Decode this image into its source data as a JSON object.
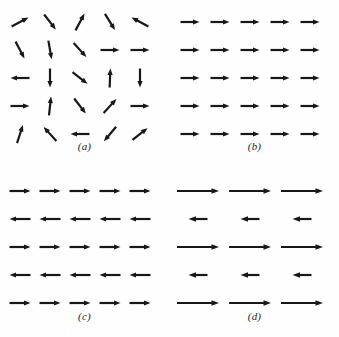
{
  "figure": {
    "background_color": "#fefefe",
    "arrow_color": "#18181a",
    "panel_grid": "2x2",
    "panels": [
      {
        "id": "a",
        "caption": "(a)",
        "rows": 5,
        "cols": 5,
        "origin_x": 20,
        "origin_y": 22,
        "step_x": 30,
        "step_y": 28,
        "arrow_length": 19,
        "stroke_width": 2.2,
        "head_length": 6.5,
        "head_width": 5.2,
        "uniform_length": true,
        "angles_deg": [
          [
            28,
            -52,
            62,
            -58,
            152
          ],
          [
            -62,
            -80,
            -48,
            0,
            0
          ],
          [
            180,
            -90,
            -38,
            88,
            -90
          ],
          [
            0,
            84,
            -52,
            48,
            0
          ],
          [
            72,
            132,
            180,
            -130,
            38
          ]
        ]
      },
      {
        "id": "b",
        "caption": "(b)",
        "rows": 5,
        "cols": 5,
        "origin_x": 20,
        "origin_y": 22,
        "step_x": 30,
        "step_y": 28,
        "arrow_length": 19,
        "stroke_width": 2.2,
        "head_length": 6.5,
        "head_width": 5.2,
        "uniform_length": true,
        "angles_deg": [
          [
            0,
            0,
            0,
            0,
            0
          ],
          [
            0,
            0,
            0,
            0,
            0
          ],
          [
            0,
            0,
            0,
            0,
            0
          ],
          [
            0,
            0,
            0,
            0,
            0
          ],
          [
            0,
            0,
            0,
            0,
            0
          ]
        ]
      },
      {
        "id": "c",
        "caption": "(c)",
        "rows": 5,
        "cols": 5,
        "origin_x": 20,
        "origin_y": 22,
        "step_x": 30,
        "step_y": 28,
        "arrow_length": 21,
        "stroke_width": 2.2,
        "head_length": 6.5,
        "head_width": 5.2,
        "uniform_length": true,
        "angles_deg": [
          [
            0,
            0,
            0,
            0,
            0
          ],
          [
            180,
            180,
            180,
            180,
            180
          ],
          [
            0,
            0,
            0,
            0,
            0
          ],
          [
            180,
            180,
            180,
            180,
            180
          ],
          [
            0,
            0,
            0,
            0,
            0
          ]
        ]
      },
      {
        "id": "d",
        "caption": "(d)",
        "rows": 5,
        "cols": 3,
        "origin_x": 28,
        "origin_y": 22,
        "step_x": 52,
        "step_y": 28,
        "stroke_width": 2.2,
        "head_length": 7.5,
        "head_width": 5.6,
        "uniform_length": false,
        "angles_deg": [
          [
            0,
            0,
            0
          ],
          [
            180,
            180,
            180
          ],
          [
            0,
            0,
            0
          ],
          [
            180,
            180,
            180
          ],
          [
            0,
            0,
            0
          ]
        ],
        "lengths": [
          [
            42,
            42,
            42
          ],
          [
            19,
            19,
            19
          ],
          [
            42,
            42,
            42
          ],
          [
            19,
            19,
            19
          ],
          [
            42,
            42,
            42
          ]
        ]
      }
    ]
  }
}
